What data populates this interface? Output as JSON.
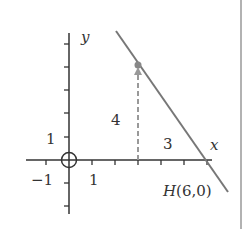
{
  "diagram": {
    "axes": {
      "x_label": "x",
      "y_label": "y",
      "x_tick_labels": {
        "neg_one": "−1",
        "one": "1"
      },
      "y_tick_labels": {
        "one": "1"
      }
    },
    "line": {
      "description": "line passing through (3,4) and H(6,0)",
      "color": "#777777"
    },
    "point": {
      "x": 3,
      "y": 4,
      "color": "#888888"
    },
    "annotations": {
      "rise": "4",
      "run": "3",
      "intercept_label": "H(6,0)"
    },
    "origin_marker": "circle",
    "colors": {
      "axis": "#333333",
      "dashed": "#999999",
      "border": "#888888"
    }
  }
}
